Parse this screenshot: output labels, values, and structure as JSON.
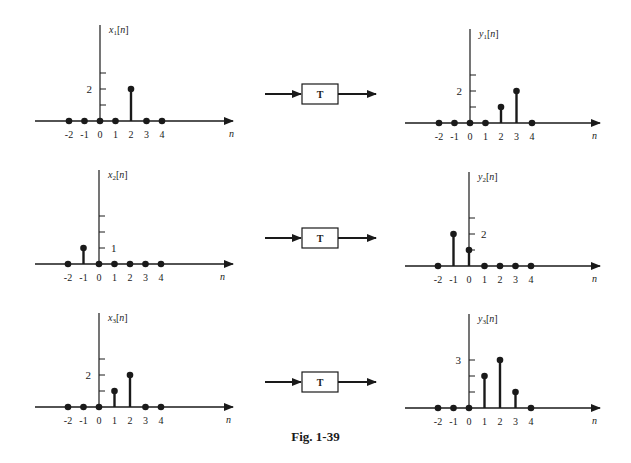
{
  "figure": {
    "caption": "Fig. 1-39",
    "system_label": "T",
    "n_label": "n",
    "ink_color": "#1a1a1a"
  },
  "chart_data": [
    {
      "type": "stem",
      "id": "x1",
      "title": "x1[n]",
      "ylabel_main": "x",
      "ylabel_sub": "1",
      "xlabel": "n",
      "x": [
        -2,
        -1,
        0,
        1,
        2,
        3,
        4
      ],
      "values": [
        0,
        0,
        0,
        0,
        2,
        0,
        0
      ],
      "ytick_labels": [
        {
          "value": 2,
          "label": "2"
        }
      ],
      "yticks": [
        1,
        2,
        3
      ],
      "tick_labels": [
        "-2",
        "-1",
        "0",
        "1",
        "2",
        "3",
        "4"
      ]
    },
    {
      "type": "stem",
      "id": "y1",
      "title": "y1[n]",
      "ylabel_main": "y",
      "ylabel_sub": "1",
      "xlabel": "n",
      "x": [
        -2,
        -1,
        0,
        1,
        2,
        3,
        4
      ],
      "values": [
        0,
        0,
        0,
        0,
        1,
        2,
        0
      ],
      "ytick_labels": [
        {
          "value": 2,
          "label": "2"
        }
      ],
      "yticks": [
        1,
        2,
        3
      ],
      "tick_labels": [
        "-2",
        "-1",
        "0",
        "1",
        "2",
        "3",
        "4"
      ]
    },
    {
      "type": "stem",
      "id": "x2",
      "title": "x2[n]",
      "ylabel_main": "x",
      "ylabel_sub": "2",
      "xlabel": "n",
      "x": [
        -2,
        -1,
        0,
        1,
        2,
        3,
        4
      ],
      "values": [
        0,
        1,
        0,
        0,
        0,
        0,
        0
      ],
      "ytick_labels": [
        {
          "value": 1,
          "label": "1"
        }
      ],
      "yticks": [
        1,
        2,
        3
      ],
      "tick_labels": [
        "-2",
        "-1",
        "0",
        "1",
        "2",
        "3",
        "4"
      ]
    },
    {
      "type": "stem",
      "id": "y2",
      "title": "y2[n]",
      "ylabel_main": "y",
      "ylabel_sub": "2",
      "xlabel": "n",
      "x": [
        -2,
        -1,
        0,
        1,
        2,
        3,
        4
      ],
      "values": [
        0,
        2,
        1,
        0,
        0,
        0,
        0
      ],
      "ytick_labels": [
        {
          "value": 2,
          "label": "2"
        }
      ],
      "yticks": [
        1,
        2,
        3
      ],
      "tick_labels": [
        "-2",
        "-1",
        "0",
        "1",
        "2",
        "3",
        "4"
      ]
    },
    {
      "type": "stem",
      "id": "x3",
      "title": "x3[n]",
      "ylabel_main": "x",
      "ylabel_sub": "3",
      "xlabel": "n",
      "x": [
        -2,
        -1,
        0,
        1,
        2,
        3,
        4
      ],
      "values": [
        0,
        0,
        0,
        1,
        2,
        0,
        0
      ],
      "ytick_labels": [
        {
          "value": 2,
          "label": "2"
        }
      ],
      "yticks": [
        1,
        2,
        3
      ],
      "tick_labels": [
        "-2",
        "-1",
        "0",
        "1",
        "2",
        "3",
        "4"
      ]
    },
    {
      "type": "stem",
      "id": "y3",
      "title": "y3[n]",
      "ylabel_main": "y",
      "ylabel_sub": "3",
      "xlabel": "n",
      "x": [
        -2,
        -1,
        0,
        1,
        2,
        3,
        4
      ],
      "values": [
        0,
        0,
        0,
        2,
        3,
        1,
        0
      ],
      "ytick_labels": [
        {
          "value": 3,
          "label": "3"
        }
      ],
      "yticks": [
        1,
        2,
        3
      ],
      "tick_labels": [
        "-2",
        "-1",
        "0",
        "1",
        "2",
        "3",
        "4"
      ]
    }
  ],
  "layout": {
    "plots": [
      {
        "ox": 100,
        "oy": 121,
        "x0": 35,
        "x1": 233,
        "ytop": 25,
        "nx": 229
      },
      {
        "ox": 470,
        "oy": 123,
        "x0": 405,
        "x1": 600,
        "ytop": 29,
        "nx": 592
      },
      {
        "ox": 99,
        "oy": 264,
        "x0": 35,
        "x1": 233,
        "ytop": 170,
        "nx": 220
      },
      {
        "ox": 469,
        "oy": 266,
        "x0": 405,
        "x1": 600,
        "ytop": 172,
        "nx": 592
      },
      {
        "ox": 99,
        "oy": 407,
        "x0": 35,
        "x1": 233,
        "ytop": 313,
        "nx": 226
      },
      {
        "ox": 469,
        "oy": 408,
        "x0": 405,
        "x1": 600,
        "ytop": 314,
        "nx": 592
      }
    ],
    "unit_x": 15.5,
    "unit_y": 16,
    "blocks": [
      {
        "y": 94
      },
      {
        "y": 238
      },
      {
        "y": 382
      }
    ]
  }
}
